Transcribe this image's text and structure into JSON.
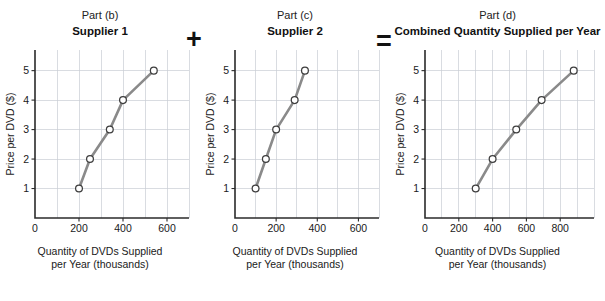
{
  "figure": {
    "operators": {
      "plus": "+",
      "equals": "="
    }
  },
  "panels": [
    {
      "part_label": "Part (b)",
      "title": "Supplier 1",
      "xlabel_line1": "Quantity of DVDs Supplied",
      "xlabel_line2": "per Year (thousands)",
      "ylabel": "Price per DVD ($)"
    },
    {
      "part_label": "Part (c)",
      "title": "Supplier 2",
      "xlabel_line1": "Quantity of DVDs Supplied",
      "xlabel_line2": "per Year (thousands)",
      "ylabel": "Price per DVD ($)"
    },
    {
      "part_label": "Part (d)",
      "title": "Combined Quantity Supplied per Year",
      "xlabel_line1": "Quantity of DVDs Supplied",
      "xlabel_line2": "per Year (thousands)",
      "ylabel": "Price per DVD ($)"
    }
  ],
  "chart_data": [
    {
      "type": "line",
      "title": "Supplier 1",
      "subtitle": "Part (b)",
      "xlabel": "Quantity of DVDs Supplied per Year (thousands)",
      "ylabel": "Price per DVD ($)",
      "x": [
        200,
        250,
        340,
        400,
        540
      ],
      "y": [
        1,
        2,
        3,
        4,
        5
      ],
      "xlim": [
        0,
        700
      ],
      "ylim": [
        0,
        5.7
      ],
      "xticks": [
        0,
        200,
        400,
        600
      ],
      "xtick_labels": [
        "0",
        "200",
        "400",
        "600"
      ],
      "yticks": [
        1,
        2,
        3,
        4,
        5
      ],
      "ytick_labels": [
        "1",
        "2",
        "3",
        "4",
        "5"
      ],
      "grid": true,
      "grid_x_step": 100,
      "grid_y_step": 1,
      "legend": "none",
      "line_color": "#8a8a8a",
      "marker_face_color": "#ffffff",
      "marker_edge_color": "#3d3d3d"
    },
    {
      "type": "line",
      "title": "Supplier 2",
      "subtitle": "Part (c)",
      "xlabel": "Quantity of DVDs Supplied per Year (thousands)",
      "ylabel": "Price per DVD ($)",
      "x": [
        100,
        150,
        200,
        290,
        340
      ],
      "y": [
        1,
        2,
        3,
        4,
        5
      ],
      "xlim": [
        0,
        700
      ],
      "ylim": [
        0,
        5.7
      ],
      "xticks": [
        0,
        200,
        400,
        600
      ],
      "xtick_labels": [
        "0",
        "200",
        "400",
        "600"
      ],
      "yticks": [
        1,
        2,
        3,
        4,
        5
      ],
      "ytick_labels": [
        "1",
        "2",
        "3",
        "4",
        "5"
      ],
      "grid": true,
      "grid_x_step": 100,
      "grid_y_step": 1,
      "legend": "none",
      "line_color": "#8a8a8a",
      "marker_face_color": "#ffffff",
      "marker_edge_color": "#3d3d3d"
    },
    {
      "type": "line",
      "title": "Combined Quantity Supplied per Year",
      "subtitle": "Part (d)",
      "xlabel": "Quantity of DVDs Supplied per Year (thousands)",
      "ylabel": "Price per DVD ($)",
      "x": [
        300,
        400,
        540,
        690,
        880
      ],
      "y": [
        1,
        2,
        3,
        4,
        5
      ],
      "xlim": [
        0,
        1000
      ],
      "ylim": [
        0,
        5.7
      ],
      "xticks": [
        0,
        200,
        400,
        600,
        800
      ],
      "xtick_labels": [
        "0",
        "200",
        "400",
        "600",
        "800"
      ],
      "yticks": [
        1,
        2,
        3,
        4,
        5
      ],
      "ytick_labels": [
        "1",
        "2",
        "3",
        "4",
        "5"
      ],
      "grid": true,
      "grid_x_step": 100,
      "grid_y_step": 1,
      "legend": "none",
      "line_color": "#8a8a8a",
      "marker_face_color": "#ffffff",
      "marker_edge_color": "#3d3d3d"
    }
  ]
}
